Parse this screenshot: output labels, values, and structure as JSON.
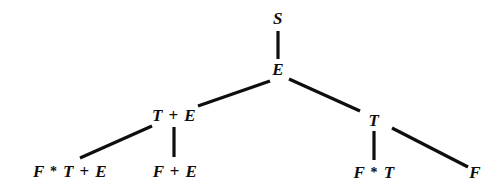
{
  "diagram": {
    "type": "derivation-tree",
    "title": "",
    "background_color": "#ffffff",
    "ink_color": "#100d0d",
    "nodes": [
      {
        "id": "root",
        "label": "S",
        "x": 278,
        "y": 19,
        "symbols": [
          "S"
        ]
      },
      {
        "id": "e1",
        "label": "E",
        "x": 278,
        "y": 70,
        "symbols": [
          "E"
        ]
      },
      {
        "id": "t-plus-e",
        "label": "T + E",
        "x": 174,
        "y": 116,
        "symbols": [
          "T",
          "+",
          "E"
        ]
      },
      {
        "id": "t-right",
        "label": "T",
        "x": 374,
        "y": 121,
        "symbols": [
          "T"
        ]
      },
      {
        "id": "f-star-t-plus-e",
        "label": "F * T + E",
        "x": 70,
        "y": 172,
        "symbols": [
          "F",
          "*",
          "T",
          "+",
          "E"
        ]
      },
      {
        "id": "f-plus-e",
        "label": "F + E",
        "x": 175,
        "y": 172,
        "symbols": [
          "F",
          "+",
          "E"
        ]
      },
      {
        "id": "f-star-t",
        "label": "F * T",
        "x": 374,
        "y": 173,
        "symbols": [
          "F",
          "*",
          "T"
        ]
      },
      {
        "id": "f-leaf",
        "label": "F",
        "x": 475,
        "y": 173,
        "symbols": [
          "F"
        ]
      }
    ],
    "edges": [
      {
        "id": "edge-root-e",
        "from": "root",
        "to": "e1",
        "x1": 278,
        "y1": 31,
        "x2": 278,
        "y2": 59
      },
      {
        "id": "edge-e-tplus",
        "from": "e1",
        "to": "t-plus-e",
        "x1": 270,
        "y1": 81,
        "x2": 198,
        "y2": 106
      },
      {
        "id": "edge-e-t",
        "from": "e1",
        "to": "t-right",
        "x1": 289,
        "y1": 79,
        "x2": 360,
        "y2": 111
      },
      {
        "id": "edge-tplus-fstartplus",
        "from": "t-plus-e",
        "to": "f-star-t-plus-e",
        "x1": 152,
        "y1": 126,
        "x2": 80,
        "y2": 158
      },
      {
        "id": "edge-tplus-fpluse",
        "from": "t-plus-e",
        "to": "f-plus-e",
        "x1": 174,
        "y1": 127,
        "x2": 174,
        "y2": 157
      },
      {
        "id": "edge-t-fstart",
        "from": "t-right",
        "to": "f-star-t",
        "x1": 374,
        "y1": 131,
        "x2": 374,
        "y2": 160
      },
      {
        "id": "edge-t-f",
        "from": "t-right",
        "to": "f-leaf",
        "x1": 392,
        "y1": 128,
        "x2": 468,
        "y2": 167
      }
    ]
  }
}
